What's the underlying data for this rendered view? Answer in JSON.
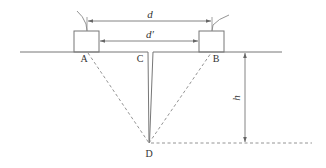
{
  "diagram": {
    "type": "crack-depth-measurement",
    "colors": {
      "line": "#777777",
      "dashed": "#888888",
      "text": "#333333",
      "background": "#ffffff"
    },
    "labels": {
      "point_a": "A",
      "point_b": "B",
      "point_c": "C",
      "point_d": "D",
      "distance_d": "d",
      "distance_d_prime": "d′",
      "depth_h": "h"
    },
    "elements": {
      "transducer_a": "Transducer at A",
      "transducer_b": "Transducer at B",
      "crack": "Crack from C down to D",
      "ground_surface": "Surface line"
    }
  }
}
